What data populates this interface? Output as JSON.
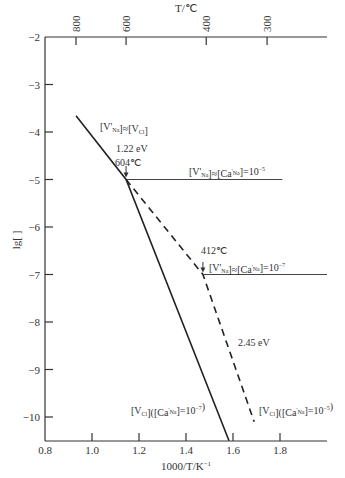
{
  "chart_data": {
    "type": "line",
    "title": "",
    "xlabel": "1000/T/K⁻¹",
    "ylabel": "lg[ ]",
    "top_xlabel": "T/℃",
    "xlim": [
      0.8,
      2.0
    ],
    "ylim": [
      -10.5,
      -2
    ],
    "grid": false,
    "x_ticks": [
      "0.8",
      "1.0",
      "1.2",
      "1.4",
      "1.6",
      "1.8"
    ],
    "y_ticks": [
      "−2",
      "−3",
      "−4",
      "−5",
      "−6",
      "−7",
      "−8",
      "−9",
      "−10"
    ],
    "top_ticks": [
      {
        "label": "800",
        "x": 0.932
      },
      {
        "label": "600",
        "x": 1.145
      },
      {
        "label": "400",
        "x": 1.486
      },
      {
        "label": "300",
        "x": 1.745
      }
    ],
    "series": [
      {
        "name": "intrinsic + doped ([Ca'Na]=10⁻⁷ ... 10⁻⁵) solid",
        "style": "solid",
        "x": [
          0.932,
          1.145,
          1.583
        ],
        "y": [
          -3.66,
          -5.0,
          -10.5
        ]
      },
      {
        "name": "[V'Na]≈[Ca'Na]=10⁻⁵",
        "style": "solid-thin",
        "x": [
          1.145,
          1.81
        ],
        "y": [
          -5.0,
          -5.0
        ]
      },
      {
        "name": "dashed (2.45 eV)",
        "style": "dashed",
        "x": [
          1.145,
          1.472,
          1.69
        ],
        "y": [
          -5.0,
          -7.0,
          -10.1
        ]
      },
      {
        "name": "[V'Na]≈[Ca'Na]=10⁻⁷",
        "style": "solid-thin",
        "x": [
          1.472,
          2.0
        ],
        "y": [
          -7.0,
          -7.0
        ]
      }
    ],
    "annotations": [
      {
        "text": "[V'Na]≈[VCl]",
        "x": 1.0,
        "y": -3.7
      },
      {
        "text": "1.22 eV",
        "x": 1.09,
        "y": -4.4
      },
      {
        "text": "604℃",
        "x": 1.08,
        "y": -4.75
      },
      {
        "text": "[V'Na]≈[Ca'Na]=10⁻⁵",
        "x": 1.42,
        "y": -4.8
      },
      {
        "text": "412℃",
        "x": 1.44,
        "y": -6.4
      },
      {
        "text": "[V'Na]≈[Ca'Na]=10⁻⁷",
        "x": 1.5,
        "y": -6.8
      },
      {
        "text": "2.45 eV",
        "x": 1.64,
        "y": -8.7
      },
      {
        "text": "[VCl]([Ca'Na]=10⁻⁷)",
        "x": 1.15,
        "y": -10.1
      },
      {
        "text": "[VCl]([Ca'Na]=10⁻⁵)",
        "x": 1.7,
        "y": -10.1
      }
    ]
  },
  "labels": {
    "top_axis_title": "T/℃",
    "bottom_axis_title": "1000/T/K",
    "bottom_axis_sup": "−1",
    "y_axis_title": "lg[ ]",
    "ann_vna_vcl": "[V'",
    "ann_122": "1.22 eV",
    "ann_604": "604℃",
    "ann_412": "412℃",
    "ann_245": "2.45 eV"
  }
}
